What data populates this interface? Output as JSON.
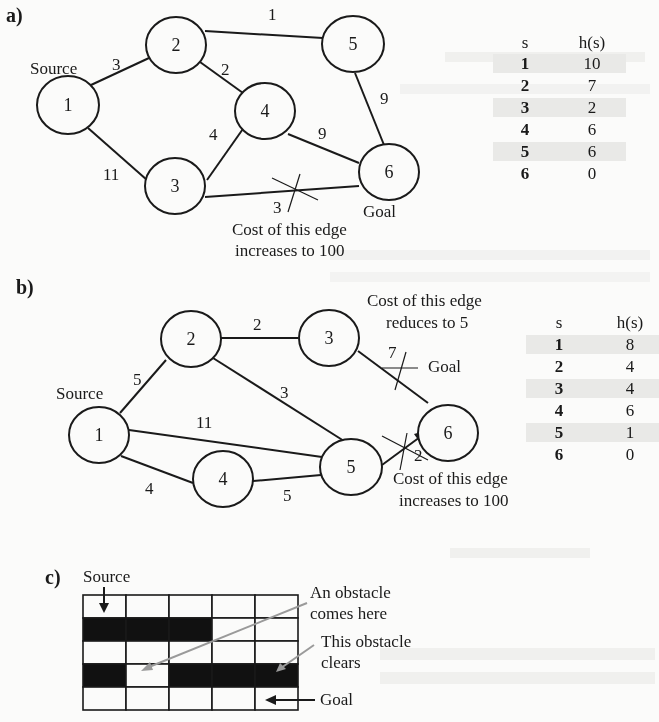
{
  "panels": {
    "a": {
      "label": "a)",
      "source_label": "Source",
      "goal_label": "Goal",
      "nodes": [
        {
          "id": "1",
          "x": 68,
          "y": 105
        },
        {
          "id": "2",
          "x": 176,
          "y": 45
        },
        {
          "id": "3",
          "x": 175,
          "y": 185
        },
        {
          "id": "4",
          "x": 265,
          "y": 110
        },
        {
          "id": "5",
          "x": 353,
          "y": 44
        },
        {
          "id": "6",
          "x": 389,
          "y": 172
        }
      ],
      "edges": [
        {
          "from": "1",
          "to": "2",
          "cost": "3"
        },
        {
          "from": "1",
          "to": "3",
          "cost": "11"
        },
        {
          "from": "2",
          "to": "5",
          "cost": "1"
        },
        {
          "from": "2",
          "to": "4",
          "cost": "2"
        },
        {
          "from": "3",
          "to": "4",
          "cost": "4"
        },
        {
          "from": "4",
          "to": "6",
          "cost": "9"
        },
        {
          "from": "5",
          "to": "6",
          "cost": "9"
        },
        {
          "from": "3",
          "to": "6",
          "cost": "3",
          "crossed": true
        }
      ],
      "annotation_line1": "Cost of this edge",
      "annotation_line2": "increases to 100",
      "table": {
        "header_s": "s",
        "header_h": "h(s)",
        "rows": [
          {
            "s": "1",
            "h": "10"
          },
          {
            "s": "2",
            "h": "7"
          },
          {
            "s": "3",
            "h": "2"
          },
          {
            "s": "4",
            "h": "6"
          },
          {
            "s": "5",
            "h": "6"
          },
          {
            "s": "6",
            "h": "0"
          }
        ]
      }
    },
    "b": {
      "label": "b)",
      "source_label": "Source",
      "goal_label": "Goal",
      "nodes": [
        {
          "id": "1",
          "x": 99,
          "y": 435
        },
        {
          "id": "2",
          "x": 190,
          "y": 340
        },
        {
          "id": "3",
          "x": 329,
          "y": 338
        },
        {
          "id": "4",
          "x": 222,
          "y": 479
        },
        {
          "id": "5",
          "x": 351,
          "y": 467
        },
        {
          "id": "6",
          "x": 448,
          "y": 433
        }
      ],
      "edges": [
        {
          "from": "1",
          "to": "2",
          "cost": "5"
        },
        {
          "from": "1",
          "to": "5",
          "cost": "11"
        },
        {
          "from": "1",
          "to": "4",
          "cost": "4"
        },
        {
          "from": "2",
          "to": "3",
          "cost": "2"
        },
        {
          "from": "2",
          "to": "5",
          "cost": "3"
        },
        {
          "from": "4",
          "to": "5",
          "cost": "5"
        },
        {
          "from": "3",
          "to": "6",
          "cost": "7",
          "crossed": true
        },
        {
          "from": "5",
          "to": "6",
          "cost": "2",
          "crossed": true,
          "directed": true
        }
      ],
      "annotation_top_line1": "Cost of this edge",
      "annotation_top_line2": "reduces to 5",
      "annotation_bottom_line1": "Cost of this edge",
      "annotation_bottom_line2": "increases to 100",
      "table": {
        "header_s": "s",
        "header_h": "h(s)",
        "rows": [
          {
            "s": "1",
            "h": "8"
          },
          {
            "s": "2",
            "h": "4"
          },
          {
            "s": "3",
            "h": "4"
          },
          {
            "s": "4",
            "h": "6"
          },
          {
            "s": "5",
            "h": "1"
          },
          {
            "s": "6",
            "h": "0"
          }
        ]
      }
    },
    "c": {
      "label": "c)",
      "source_label": "Source",
      "obstacle_comes_line1": "An obstacle",
      "obstacle_comes_line2": "comes here",
      "obstacle_clears_line1": "This obstacle",
      "obstacle_clears_line2": "clears",
      "goal_label": "Goal",
      "grid": [
        [
          0,
          0,
          0,
          0,
          0
        ],
        [
          1,
          1,
          1,
          0,
          0
        ],
        [
          0,
          0,
          0,
          0,
          0
        ],
        [
          1,
          0,
          1,
          1,
          1
        ],
        [
          0,
          0,
          0,
          0,
          0
        ]
      ]
    }
  },
  "colors": {
    "ink": "#1a1a1a",
    "background": "#fbfbfa",
    "table_shade": "#e9e9e7",
    "annotation_arrow": "#9a9a9a"
  }
}
